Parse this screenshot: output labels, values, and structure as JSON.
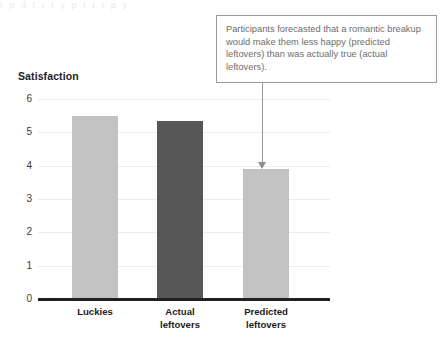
{
  "figure": {
    "background": "#ffffff",
    "scan_bleed_text": "t p  d  t  t   t  y  p     t     t      t   p   y"
  },
  "callout": {
    "text": "Participants forecasted that a romantic breakup would make them less happy (predicted leftovers) than was actually true (actual leftovers).",
    "border_color": "#9a9a9a",
    "text_color": "#6d6d6d",
    "pointer": "down-arrow-to-predicted-leftovers-bar"
  },
  "chart_data": {
    "type": "bar",
    "title": "",
    "xlabel": "",
    "ylabel": "Satisfaction",
    "categories": [
      "Luckies",
      "Actual leftovers",
      "Predicted leftovers"
    ],
    "category_lines": [
      [
        "Luckies"
      ],
      [
        "Actual",
        "leftovers"
      ],
      [
        "Predicted",
        "leftovers"
      ]
    ],
    "values": [
      5.5,
      5.35,
      3.9
    ],
    "ylim": [
      0,
      6
    ],
    "yticks": [
      0,
      1,
      2,
      3,
      4,
      5,
      6
    ],
    "ytick_labels": [
      "0",
      "1",
      "2",
      "3",
      "4",
      "5",
      "6"
    ],
    "grid": true,
    "legend": "none",
    "bar_colors": [
      "#c2c2c2",
      "#575757",
      "#c2c2c2"
    ],
    "axis_color": "#231f20",
    "grid_color": "#ececec"
  }
}
